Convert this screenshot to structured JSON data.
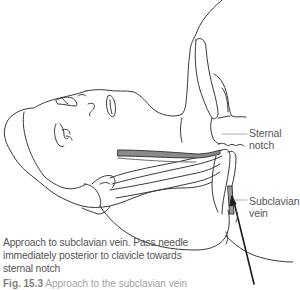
{
  "figure": {
    "labels": {
      "sternal_line1": "Sternal",
      "sternal_line2": "notch",
      "subclavian_line1": "Subclavian",
      "subclavian_line2": "vein"
    },
    "description": "Approach to subclavian vein. Pass needle immediately posterior to clavicle towards sternal notch",
    "description_lines": [
      "Approach to subclavian vein. Pass needle",
      "immediately posterior to clavicle towards",
      "sternal notch"
    ],
    "caption": {
      "number": "Fig. 15.3",
      "text": "Approach to the subclavian vein",
      "partially_visible": true
    },
    "colors": {
      "line": "#3a3a3a",
      "muscle_fill": "#8a8a8a",
      "vein_fill": "#9a9a9a",
      "needle": "#1a1a1a",
      "text": "#555555"
    }
  }
}
